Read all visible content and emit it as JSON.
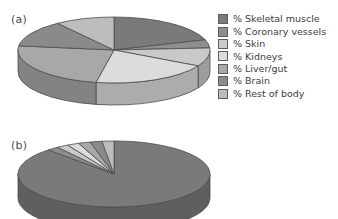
{
  "figure": {
    "panels": [
      {
        "id": "a",
        "label": "(a)"
      },
      {
        "id": "b",
        "label": "(b)"
      }
    ]
  },
  "legend": {
    "position": "right",
    "items": [
      {
        "label": "% Skeletal muscle",
        "color": "#7a7a7a",
        "swatch_name": "swatch-skeletal-muscle"
      },
      {
        "label": "% Coronary vessels",
        "color": "#8e8e8e",
        "swatch_name": "swatch-coronary-vessels"
      },
      {
        "label": "% Skin",
        "color": "#c9c9c9",
        "swatch_name": "swatch-skin"
      },
      {
        "label": "% Kidneys",
        "color": "#dcdcdc",
        "swatch_name": "swatch-kidneys"
      },
      {
        "label": "% Liver/gut",
        "color": "#a8a8a8",
        "swatch_name": "swatch-liver-gut"
      },
      {
        "label": "% Brain",
        "color": "#8a8a8a",
        "swatch_name": "swatch-brain"
      },
      {
        "label": "% Rest of body",
        "color": "#bdbdbd",
        "swatch_name": "swatch-rest-of-body"
      }
    ]
  },
  "chart_data": [
    {
      "type": "pie",
      "id": "a",
      "title": "(a)",
      "labels": [
        "% Skeletal muscle",
        "% Coronary vessels",
        "% Skin",
        "% Kidneys",
        "% Liver/gut",
        "% Brain",
        "% Rest of body"
      ],
      "values": [
        20,
        4,
        9,
        20,
        24,
        13,
        10
      ],
      "colors": [
        "#7a7a7a",
        "#8e8e8e",
        "#c9c9c9",
        "#dcdcdc",
        "#a8a8a8",
        "#8a8a8a",
        "#bdbdbd"
      ],
      "three_d": true,
      "start_angle_deg": -90,
      "legend": "shared-right",
      "grid": false
    },
    {
      "type": "pie",
      "id": "b",
      "title": "(b)",
      "labels": [
        "% Skeletal muscle",
        "% Coronary vessels",
        "% Skin",
        "% Kidneys",
        "% Liver/gut",
        "% Brain",
        "% Rest of body"
      ],
      "values": [
        88,
        2,
        2,
        2,
        2,
        2,
        2
      ],
      "colors": [
        "#7a7a7a",
        "#8e8e8e",
        "#c9c9c9",
        "#dcdcdc",
        "#a8a8a8",
        "#8a8a8a",
        "#bdbdbd"
      ],
      "three_d": true,
      "start_angle_deg": -90,
      "legend": "shared-right",
      "grid": false
    }
  ]
}
